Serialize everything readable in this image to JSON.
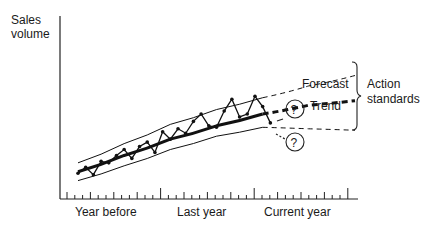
{
  "chart_data": {
    "type": "line",
    "title": "",
    "ylabel": [
      "Sales",
      "volume"
    ],
    "xlabel": "",
    "x_period_labels": [
      "Year before",
      "Last year",
      "Current year"
    ],
    "ticks_per_period": 12,
    "xlim": [
      0,
      36
    ],
    "ylim": [
      0,
      100
    ],
    "grid": false,
    "series": [
      {
        "name": "Actual sales",
        "style": "zigzag-with-dots",
        "x": [
          0,
          1,
          2,
          3,
          4,
          5,
          6,
          7,
          8,
          9,
          10,
          11,
          12,
          13,
          14,
          15,
          16,
          17,
          18,
          19,
          20,
          21,
          22,
          23,
          24,
          25
        ],
        "y": [
          10,
          14,
          9,
          18,
          17,
          22,
          26,
          20,
          28,
          31,
          24,
          38,
          33,
          40,
          37,
          45,
          50,
          42,
          41,
          52,
          60,
          48,
          50,
          62,
          55,
          44
        ]
      },
      {
        "name": "Trend",
        "style": "thick-solid",
        "x": [
          0,
          6,
          12,
          18,
          24
        ],
        "y": [
          11,
          22,
          33,
          42,
          50
        ]
      },
      {
        "name": "Upper band",
        "style": "thin-solid",
        "x": [
          0,
          6,
          12,
          18,
          24
        ],
        "y": [
          17,
          30,
          43,
          53,
          61
        ]
      },
      {
        "name": "Lower band",
        "style": "thin-solid",
        "x": [
          0,
          6,
          12,
          18,
          24
        ],
        "y": [
          5,
          15,
          26,
          35,
          41
        ]
      },
      {
        "name": "Forecast upper",
        "style": "thin-dashed",
        "x": [
          24,
          30,
          36
        ],
        "y": [
          61,
          69,
          76
        ]
      },
      {
        "name": "Trend forecast",
        "style": "thick-dashed",
        "x": [
          24,
          30,
          36
        ],
        "y": [
          50,
          56,
          59
        ]
      },
      {
        "name": "Forecast lower",
        "style": "thin-dashed",
        "x": [
          24,
          30,
          36
        ],
        "y": [
          41,
          40,
          39
        ]
      }
    ],
    "annotations": {
      "forecast_label": "Forecast",
      "trend_label": "Trend",
      "bracket_label": [
        "Action",
        "standards"
      ],
      "question_mark": "?"
    }
  }
}
